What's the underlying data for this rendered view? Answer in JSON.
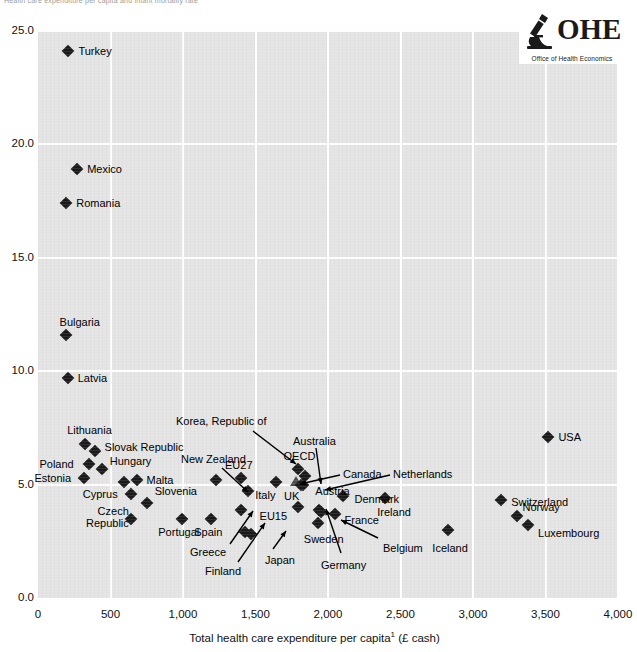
{
  "figure": {
    "top_cut_title": "Health care expenditure per capita and infant mortality rate",
    "logo": {
      "wordmark": "OHE",
      "subtitle": "Office of Health Economics",
      "icon": "microscope-icon"
    }
  },
  "axes": {
    "x": {
      "label": "Total health care expenditure per capita",
      "label_superscript": "1",
      "label_suffix": " (£ cash)",
      "ticks": [
        "0",
        "500",
        "1,000",
        "1,500",
        "2,000",
        "2,500",
        "3,000",
        "3,500",
        "4,000"
      ],
      "min": 0,
      "max": 4000,
      "step": 500
    },
    "y": {
      "label": "",
      "ticks": [
        "0.0",
        "5.0",
        "10.0",
        "15.0",
        "20.0",
        "25.0"
      ],
      "min": 0,
      "max": 25,
      "step": 5
    }
  },
  "chart_data": {
    "type": "scatter",
    "title": "Health care expenditure per capita and infant mortality rate",
    "xlabel": "Total health care expenditure per capita (£ cash)",
    "ylabel": "Infant mortality rate (per 1,000 live births)",
    "xlim": [
      0,
      4000
    ],
    "ylim": [
      0,
      25
    ],
    "grid": true,
    "legend": "none",
    "points": [
      {
        "label": "Turkey",
        "x": 210,
        "y": 24.1,
        "marker": "diamond",
        "label_pos": "right"
      },
      {
        "label": "Mexico",
        "x": 270,
        "y": 18.9,
        "marker": "diamond",
        "label_pos": "right"
      },
      {
        "label": "Romania",
        "x": 195,
        "y": 17.4,
        "marker": "diamond",
        "label_pos": "right"
      },
      {
        "label": "Bulgaria",
        "x": 190,
        "y": 11.6,
        "marker": "diamond",
        "label_pos": "above"
      },
      {
        "label": "Latvia",
        "x": 205,
        "y": 9.7,
        "marker": "diamond",
        "label_pos": "right"
      },
      {
        "label": "Lithuania",
        "x": 325,
        "y": 6.8,
        "marker": "diamond",
        "label_pos": "above"
      },
      {
        "label": "Slovak Republic",
        "x": 390,
        "y": 6.5,
        "marker": "diamond",
        "label_pos": "right"
      },
      {
        "label": "Poland",
        "x": 355,
        "y": 5.9,
        "marker": "diamond",
        "label_pos": "left"
      },
      {
        "label": "Hungary",
        "x": 440,
        "y": 5.7,
        "marker": "diamond",
        "label_pos": "right"
      },
      {
        "label": "Estonia",
        "x": 320,
        "y": 5.3,
        "marker": "diamond",
        "label_pos": "left"
      },
      {
        "label": "Korea, Republic of",
        "x": 590,
        "y": 5.1,
        "marker": "diamond",
        "label_pos": "leader"
      },
      {
        "label": "Malta",
        "x": 680,
        "y": 5.2,
        "marker": "diamond",
        "label_pos": "right"
      },
      {
        "label": "Cyprus",
        "x": 640,
        "y": 4.6,
        "marker": "diamond",
        "label_pos": "left"
      },
      {
        "label": "Slovenia",
        "x": 750,
        "y": 4.2,
        "marker": "diamond",
        "label_pos": "above-right"
      },
      {
        "label": "Czech Republic",
        "x": 640,
        "y": 3.5,
        "marker": "diamond",
        "label_pos": "left"
      },
      {
        "label": "Portugal",
        "x": 995,
        "y": 3.5,
        "marker": "diamond",
        "label_pos": "below"
      },
      {
        "label": "Spain",
        "x": 1195,
        "y": 3.5,
        "marker": "diamond",
        "label_pos": "below"
      },
      {
        "label": "New Zealand",
        "x": 1230,
        "y": 5.2,
        "marker": "diamond",
        "label_pos": "leader"
      },
      {
        "label": "Greece",
        "x": 1400,
        "y": 3.9,
        "marker": "diamond",
        "label_pos": "leader"
      },
      {
        "label": "Finland",
        "x": 1430,
        "y": 2.9,
        "marker": "diamond",
        "label_pos": "leader"
      },
      {
        "label": "Japan",
        "x": 1470,
        "y": 2.8,
        "marker": "diamond",
        "label_pos": "leader"
      },
      {
        "label": "EU27",
        "x": 1400,
        "y": 5.3,
        "marker": "diamond",
        "label_pos": "above"
      },
      {
        "label": "Italy",
        "x": 1450,
        "y": 4.7,
        "marker": "diamond",
        "label_pos": "right"
      },
      {
        "label": "Australia",
        "x": 1640,
        "y": 5.1,
        "marker": "diamond",
        "label_pos": "leader"
      },
      {
        "label": "OECD",
        "x": 1790,
        "y": 5.7,
        "marker": "diamond",
        "label_pos": "above"
      },
      {
        "label": "Canada",
        "x": 1840,
        "y": 5.4,
        "marker": "diamond",
        "label_pos": "leader"
      },
      {
        "label": "UK",
        "x": 1780,
        "y": 5.1,
        "marker": "triangle",
        "label_pos": "below-left"
      },
      {
        "label": "Netherlands",
        "x": 1815,
        "y": 5.0,
        "marker": "diamond",
        "label_pos": "leader"
      },
      {
        "label": "Austria",
        "x": 1830,
        "y": 5.0,
        "marker": "diamond",
        "label_pos": "right"
      },
      {
        "label": "EU15",
        "x": 1790,
        "y": 4.0,
        "marker": "diamond",
        "label_pos": "left"
      },
      {
        "label": "Germany",
        "x": 1940,
        "y": 3.9,
        "marker": "diamond",
        "label_pos": "leader"
      },
      {
        "label": "Belgium",
        "x": 1955,
        "y": 3.8,
        "marker": "diamond",
        "label_pos": "leader"
      },
      {
        "label": "Sweden",
        "x": 1930,
        "y": 3.3,
        "marker": "diamond",
        "label_pos": "below"
      },
      {
        "label": "France",
        "x": 2045,
        "y": 3.7,
        "marker": "diamond",
        "label_pos": "right"
      },
      {
        "label": "Denmark",
        "x": 2100,
        "y": 4.5,
        "marker": "diamond",
        "label_pos": "right"
      },
      {
        "label": "Ireland",
        "x": 2395,
        "y": 4.4,
        "marker": "diamond",
        "label_pos": "left-below"
      },
      {
        "label": "Iceland",
        "x": 2830,
        "y": 3.0,
        "marker": "diamond",
        "label_pos": "below"
      },
      {
        "label": "Switzerland",
        "x": 3195,
        "y": 4.3,
        "marker": "diamond",
        "label_pos": "right"
      },
      {
        "label": "Norway",
        "x": 3300,
        "y": 3.6,
        "marker": "diamond",
        "label_pos": "above-right"
      },
      {
        "label": "Luxembourg",
        "x": 3380,
        "y": 3.2,
        "marker": "diamond",
        "label_pos": "right"
      },
      {
        "label": "USA",
        "x": 3520,
        "y": 7.1,
        "marker": "diamond",
        "label_pos": "right"
      }
    ],
    "labels_with_leaders": [
      "Korea, Republic of",
      "New Zealand",
      "Australia",
      "Canada",
      "Netherlands",
      "Greece",
      "Finland",
      "Japan",
      "Germany",
      "Belgium"
    ]
  }
}
